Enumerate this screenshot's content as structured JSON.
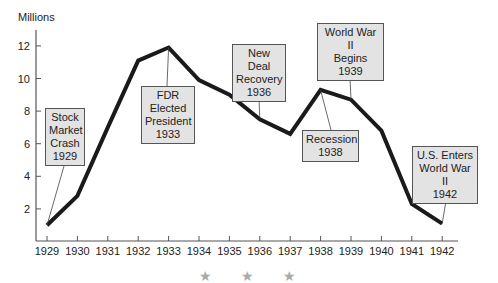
{
  "chart_data": {
    "type": "line",
    "title": "",
    "ylabel": "Millions",
    "xlabel": "",
    "ylim": [
      0,
      13
    ],
    "yticks": [
      2,
      4,
      6,
      8,
      10,
      12
    ],
    "categories": [
      "1929",
      "1930",
      "1931",
      "1932",
      "1933",
      "1934",
      "1935",
      "1936",
      "1937",
      "1938",
      "1939",
      "1940",
      "1941",
      "1942"
    ],
    "series": [
      {
        "name": "Unemployment (Millions)",
        "values": [
          1.0,
          2.8,
          7.0,
          11.1,
          11.9,
          9.9,
          9.0,
          7.5,
          6.6,
          9.3,
          8.7,
          6.8,
          2.3,
          1.1
        ]
      }
    ],
    "grid": false,
    "legend": "none",
    "annotations": [
      {
        "lines": [
          "Stock",
          "Market",
          "Crash",
          "1929"
        ],
        "year": "1929"
      },
      {
        "lines": [
          "FDR",
          "Elected",
          "President",
          "1933"
        ],
        "year": "1933"
      },
      {
        "lines": [
          "New Deal",
          "Recovery",
          "1936"
        ],
        "year": "1936"
      },
      {
        "lines": [
          "Recession",
          "1938"
        ],
        "year": "1938"
      },
      {
        "lines": [
          "World War II",
          "Begins",
          "1939"
        ],
        "year": "1939"
      },
      {
        "lines": [
          "U.S. Enters",
          "World War II",
          "1942"
        ],
        "year": "1942"
      }
    ]
  },
  "labels": {
    "y_axis_title": "Millions",
    "yticks": [
      "2",
      "4",
      "6",
      "8",
      "10",
      "12"
    ],
    "xticks": [
      "1929",
      "1930",
      "1931",
      "1932",
      "1933",
      "1934",
      "1935",
      "1936",
      "1937",
      "1938",
      "1939",
      "1940",
      "1941",
      "1942"
    ]
  },
  "decor": {
    "star": "★"
  }
}
